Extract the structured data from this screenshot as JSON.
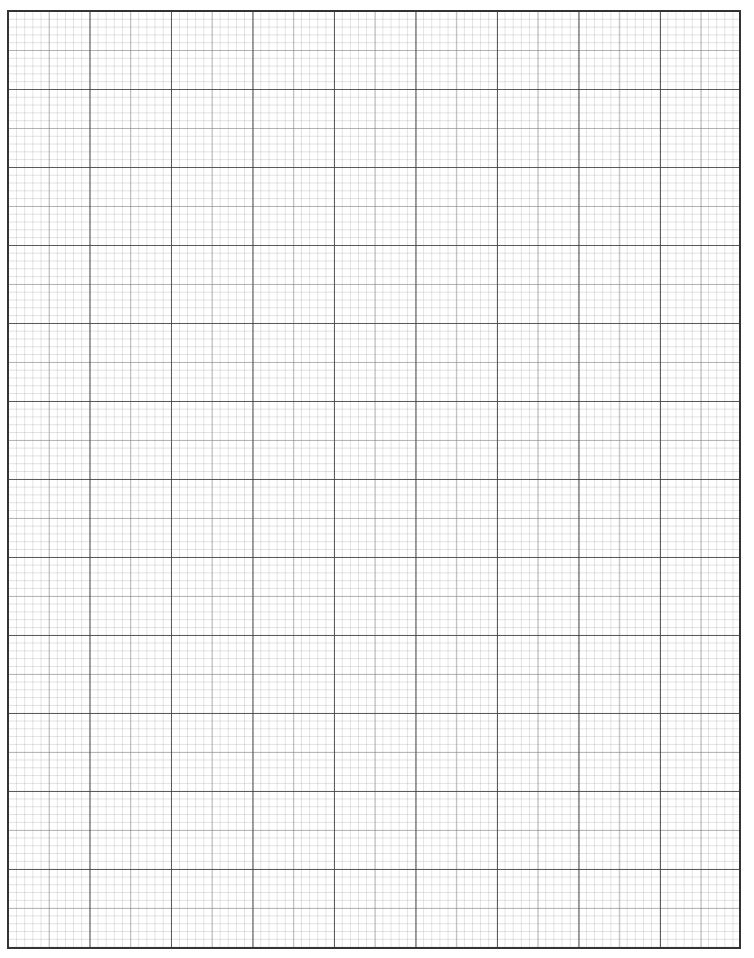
{
  "document": {
    "type": "graph-paper",
    "grid": {
      "major_columns": 9,
      "major_rows": 12,
      "minor_subdivisions_per_major": 10,
      "line_color": "#333333",
      "minor_line_color": "#aaaaaa"
    }
  }
}
